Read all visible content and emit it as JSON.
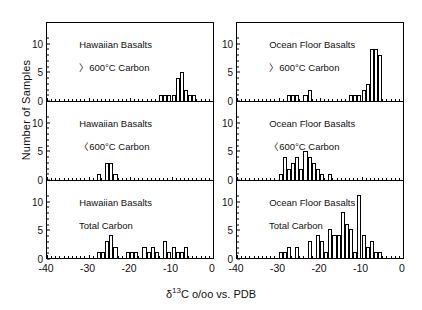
{
  "figure": {
    "ylabel": "Number of Samples",
    "xlabel_delta": "δ13C o/oo vs. PDB",
    "xlabel_pre": "δ",
    "xlabel_sup": "13",
    "xlabel_post": "C o/oo vs. PDB"
  },
  "axes": {
    "x_ticks": [
      "-40",
      "-30",
      "-20",
      "-10",
      "0"
    ],
    "x_tick_values": [
      -40,
      -30,
      -20,
      -10,
      0
    ],
    "x_min": -40,
    "x_max": 0,
    "y_ticks": [
      "0",
      "5",
      "10"
    ],
    "y_tick_values": [
      0,
      5,
      10
    ],
    "y_min": 0,
    "y_max": 12
  },
  "chart_data": {
    "type": "bar",
    "title": "",
    "xlabel": "δ13C o/oo vs. PDB",
    "ylabel": "Number of Samples",
    "xlim": [
      -40,
      0
    ],
    "ylim": [
      0,
      12
    ],
    "grid": false,
    "legend": "none",
    "bin_width": 1,
    "panels": [
      {
        "id": "hawaiian-gt600",
        "column": "left",
        "row": 0,
        "title_line1": "Hawaiian Basalts",
        "title_line2": "〉600°C Carbon",
        "bins": [
          -13,
          -12,
          -11,
          -10,
          -9,
          -8,
          -7,
          -6,
          -5
        ],
        "values": [
          1,
          1,
          1,
          1,
          4,
          5,
          2,
          1,
          1
        ]
      },
      {
        "id": "hawaiian-lt600",
        "column": "left",
        "row": 1,
        "title_line1": "Hawaiian Basalts",
        "title_line2": "〈600°C Carbon",
        "bins": [
          -28,
          -26,
          -25,
          -24,
          -23
        ],
        "values": [
          1,
          3,
          3,
          1,
          0
        ]
      },
      {
        "id": "hawaiian-total",
        "column": "left",
        "row": 2,
        "title_line1": "Hawaiian Basalts",
        "title_line2": "Total Carbon",
        "bins": [
          -28,
          -27,
          -26,
          -25,
          -24,
          -22,
          -21,
          -20,
          -19,
          -18,
          -17,
          -16,
          -15,
          -14,
          -13,
          -12,
          -11,
          -10,
          -9,
          -8,
          -7,
          -6
        ],
        "values": [
          1,
          1,
          3,
          4,
          2,
          0,
          1,
          1,
          1,
          0,
          2,
          1,
          2,
          1,
          0,
          3,
          1,
          2,
          1,
          1,
          2,
          0
        ]
      },
      {
        "id": "ocean-gt600",
        "column": "right",
        "row": 0,
        "title_line1": "Ocean Floor Basalts",
        "title_line2": "〉600°C Carbon",
        "bins": [
          -28,
          -27,
          -26,
          -24,
          -23,
          -13,
          -12,
          -11,
          -10,
          -9,
          -8,
          -7,
          -6
        ],
        "values": [
          1,
          1,
          1,
          1,
          2,
          1,
          1,
          1,
          2,
          3,
          9,
          9,
          8
        ]
      },
      {
        "id": "ocean-lt600",
        "column": "right",
        "row": 1,
        "title_line1": "Ocean Floor Basalts",
        "title_line2": "〈600°C Carbon",
        "bins": [
          -30,
          -29,
          -28,
          -27,
          -26,
          -25,
          -24,
          -23,
          -22,
          -21,
          -20,
          -19,
          -18
        ],
        "values": [
          1,
          4,
          2,
          3,
          4,
          2,
          5,
          4,
          3,
          2,
          1,
          0,
          1
        ]
      },
      {
        "id": "ocean-total",
        "column": "right",
        "row": 2,
        "title_line1": "Ocean Floor Basalts",
        "title_line2": "Total Carbon",
        "bins": [
          -30,
          -29,
          -28,
          -27,
          -26,
          -24,
          -23,
          -21,
          -20,
          -19,
          -18,
          -17,
          -16,
          -15,
          -14,
          -13,
          -12,
          -11,
          -10,
          -9,
          -8,
          -7,
          -6,
          -5
        ],
        "values": [
          1,
          1,
          2,
          0,
          2,
          0,
          3,
          4,
          3,
          1,
          5,
          4,
          4,
          8,
          6,
          5,
          1,
          11,
          4,
          2,
          3,
          1,
          1,
          0
        ]
      }
    ]
  }
}
